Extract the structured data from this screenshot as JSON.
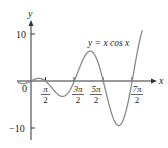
{
  "chart_data": {
    "type": "line",
    "title": "",
    "xlabel": "x",
    "ylabel": "y",
    "series": [
      {
        "name": "y = x cos x",
        "function": "x*cos(x)",
        "x_range": [
          -1.5,
          12.1
        ]
      }
    ],
    "x_ticks": [
      {
        "value": 0,
        "label": "0"
      },
      {
        "value": 1.5708,
        "label": "π/2",
        "num": "π",
        "den": "2"
      },
      {
        "value": 4.7124,
        "label": "3π/2",
        "num": "3π",
        "den": "2"
      },
      {
        "value": 7.854,
        "label": "5π/2",
        "num": "5π",
        "den": "2"
      },
      {
        "value": 10.9956,
        "label": "7π/2",
        "num": "7π",
        "den": "2"
      }
    ],
    "y_ticks": [
      {
        "value": 10,
        "label": "10"
      },
      {
        "value": -10,
        "label": "−10"
      }
    ],
    "annotations": [
      {
        "text": "y = x cos x",
        "near_x": 9.5,
        "near_y": 8.5
      }
    ],
    "xlim": [
      -1.5,
      13.5
    ],
    "ylim": [
      -11.5,
      13
    ],
    "grid": false,
    "legend": "none",
    "colors": {
      "axis": "#333333",
      "curve": "#8a8a8a",
      "text": "#222222"
    }
  },
  "labels": {
    "y_axis": "y",
    "x_axis": "x",
    "origin": "0",
    "y_top": "10",
    "y_bottom": "−10",
    "t1_num": "π",
    "t1_den": "2",
    "t2_num": "3π",
    "t2_den": "2",
    "t3_num": "5π",
    "t3_den": "2",
    "t4_num": "7π",
    "t4_den": "2",
    "equation": "y = x cos x"
  }
}
